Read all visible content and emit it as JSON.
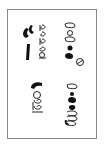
{
  "document": {
    "type": "rotated glyph page",
    "orientation": "rotated 90deg",
    "colors": {
      "ink": "#111111",
      "border": "#8a8a8a",
      "background": "#ffffff"
    },
    "clusters": [
      {
        "id": "top-left",
        "description": "two bold strokes beside a column of looped outline glyphs"
      },
      {
        "id": "top-right",
        "description": "column of outline loops and filled dots ending with a circled glyph"
      },
      {
        "id": "bottom-left",
        "description": "bold arc above open loop glyphs"
      },
      {
        "id": "bottom-right",
        "description": "column of loops and filled dots ending in looped scribble"
      }
    ]
  }
}
